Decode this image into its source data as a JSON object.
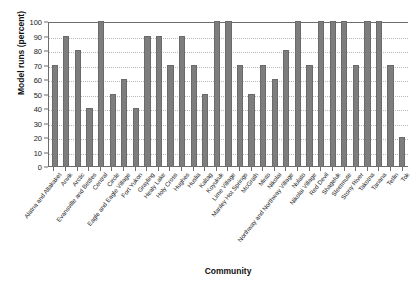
{
  "chart_data": {
    "type": "bar",
    "title": "",
    "subtitle": "",
    "xlabel": "Community",
    "ylabel": "Model runs (percent)",
    "ylim": [
      0,
      100
    ],
    "yticks": [
      0,
      10,
      20,
      30,
      40,
      50,
      60,
      70,
      80,
      90,
      100
    ],
    "grid": "horizontal-dotted",
    "legend": "none",
    "bar_color": "#7d7d7d",
    "bar_edge_color": "#6a6a6a",
    "axis_color": "#6d6d6d",
    "gridline_color": "#b9b9b9",
    "categories": [
      "Alatna and Allakaket",
      "Anvik",
      "Arctic",
      "Evansville and Bettles",
      "Central",
      "Circle",
      "Eagle and Eagle Village",
      "Fort Yukon",
      "Grayling",
      "Healy Lake",
      "Holy Cross",
      "Hughes",
      "Huslia",
      "Kaltag",
      "Koyukuk",
      "Lime Village",
      "Manley Hot Springs",
      "McGrath",
      "Minto",
      "Nikolai",
      "Northway and Northway Village",
      "Nulato",
      "Nikolai Village",
      "Red Devil",
      "Shageluk",
      "Sleetmute",
      "Stony River",
      "Takotna",
      "Tanana",
      "Tetlin",
      "Tok"
    ],
    "values": [
      70,
      90,
      80,
      40,
      100,
      50,
      60,
      40,
      90,
      90,
      70,
      90,
      70,
      50,
      100,
      100,
      70,
      50,
      70,
      60,
      80,
      100,
      70,
      100,
      100,
      100,
      70,
      100,
      100,
      70,
      20
    ]
  }
}
